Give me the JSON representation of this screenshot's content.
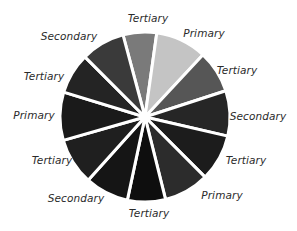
{
  "diagram": {
    "type": "color-wheel",
    "center": [
      145,
      117
    ],
    "radius": 85,
    "gap_color": "#ffffff",
    "segments": [
      {
        "label": "Tertiary",
        "start": -15,
        "end": 8,
        "color": "#7a7a7a",
        "label_pos": [
          148,
          18
        ]
      },
      {
        "label": "Primary",
        "start": 8,
        "end": 43,
        "color": "#c4c4c4",
        "label_pos": [
          204,
          33
        ]
      },
      {
        "label": "Tertiary",
        "start": 43,
        "end": 72,
        "color": "#565656",
        "label_pos": [
          237,
          70
        ]
      },
      {
        "label": "Secondary",
        "start": 72,
        "end": 103,
        "color": "#262626",
        "label_pos": [
          258,
          116
        ]
      },
      {
        "label": "Tertiary",
        "start": 103,
        "end": 135,
        "color": "#1c1c1c",
        "label_pos": [
          246,
          160
        ]
      },
      {
        "label": "Primary",
        "start": 135,
        "end": 166,
        "color": "#2c2c2c",
        "label_pos": [
          222,
          195
        ]
      },
      {
        "label": "Tertiary",
        "start": 166,
        "end": 192,
        "color": "#0e0e0e",
        "label_pos": [
          149,
          213
        ]
      },
      {
        "label": "Secondary",
        "start": 192,
        "end": 222,
        "color": "#151515",
        "label_pos": [
          76,
          198
        ]
      },
      {
        "label": "Tertiary",
        "start": 222,
        "end": 254,
        "color": "#1f1f1f",
        "label_pos": [
          52,
          160
        ]
      },
      {
        "label": "Primary",
        "start": 254,
        "end": 287,
        "color": "#1a1a1a",
        "label_pos": [
          34,
          115
        ]
      },
      {
        "label": "Tertiary",
        "start": 287,
        "end": 315,
        "color": "#242424",
        "label_pos": [
          44,
          76
        ]
      },
      {
        "label": "Secondary",
        "start": 315,
        "end": 345,
        "color": "#3a3a3a",
        "label_pos": [
          69,
          36
        ]
      }
    ]
  },
  "labels": {
    "s0": "Tertiary",
    "s1": "Primary",
    "s2": "Tertiary",
    "s3": "Secondary",
    "s4": "Tertiary",
    "s5": "Primary",
    "s6": "Tertiary",
    "s7": "Secondary",
    "s8": "Tertiary",
    "s9": "Primary",
    "s10": "Tertiary",
    "s11": "Secondary"
  }
}
